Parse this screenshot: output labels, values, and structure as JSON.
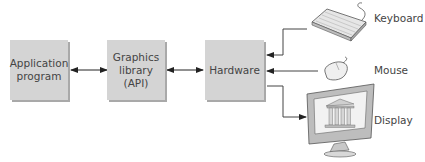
{
  "diagram": {
    "boxes": [
      {
        "id": "application",
        "line1": "Application",
        "line2": "program"
      },
      {
        "id": "graphics",
        "line1": "Graphics",
        "line2": "library",
        "line3": "(API)"
      },
      {
        "id": "hardware",
        "line1": "Hardware"
      }
    ],
    "devices": [
      {
        "id": "keyboard",
        "label": "Keyboard",
        "icon": "keyboard-icon"
      },
      {
        "id": "mouse",
        "label": "Mouse",
        "icon": "mouse-icon"
      },
      {
        "id": "display",
        "label": "Display",
        "icon": "monitor-icon"
      }
    ],
    "colors": {
      "box_fill": "#d4d4d4",
      "box_shadow": "#a9a9a9",
      "line": "#333333"
    }
  }
}
